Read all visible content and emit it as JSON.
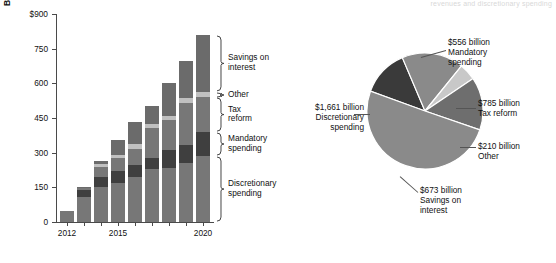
{
  "figure": {
    "top_note": "revenues and discretionary spending"
  },
  "chart_data": [
    {
      "type": "bar",
      "subtype": "stacked-bar",
      "title": "",
      "xlabel": "",
      "ylabel": "Billion",
      "y_axis_top_label": "$900",
      "ylim": [
        0,
        900
      ],
      "yticks": [
        0,
        150,
        300,
        450,
        600,
        750,
        900
      ],
      "ytick_labels": [
        "0",
        "150",
        "300",
        "450",
        "600",
        "750",
        "$900"
      ],
      "grid": false,
      "legend_position": "right-brackets",
      "categories": [
        "2012",
        "2013",
        "2014",
        "2015",
        "2016",
        "2017",
        "2018",
        "2019",
        "2020"
      ],
      "xtick_labels_shown": [
        "2012",
        "2015",
        "2020"
      ],
      "series": [
        {
          "name": "Discretionary spending",
          "color": "#777777",
          "values": [
            48,
            110,
            152,
            168,
            196,
            228,
            232,
            254,
            286
          ]
        },
        {
          "name": "Mandatory spending",
          "color": "#3f3f3f",
          "values": [
            0,
            28,
            42,
            52,
            50,
            48,
            78,
            78,
            104
          ]
        },
        {
          "name": "Tax reform",
          "color": "#777777",
          "values": [
            0,
            10,
            44,
            56,
            72,
            130,
            130,
            182,
            152
          ]
        },
        {
          "name": "Other",
          "color": "#c0c0c0",
          "values": [
            0,
            0,
            12,
            16,
            18,
            20,
            20,
            22,
            22
          ]
        },
        {
          "name": "Savings on interest",
          "color": "#6b6b6b",
          "values": [
            0,
            2,
            14,
            64,
            96,
            76,
            140,
            160,
            246
          ]
        }
      ],
      "totals": [
        48,
        150,
        264,
        356,
        432,
        502,
        600,
        696,
        810
      ],
      "bracket_labels": [
        "Savings on\ninterest",
        "Other",
        "Tax\nreform",
        "Mandatory\nspending",
        "Discretionary\nspending"
      ]
    },
    {
      "type": "pie",
      "title": "",
      "unit": "billion",
      "legend_position": "callout-labels",
      "slices": [
        {
          "label": "Discretionary spending",
          "value_text": "$1,661 billion",
          "value": 1661,
          "color": "#8a8a8a",
          "callout": "$1,661 billion\nDiscretionary\nspending"
        },
        {
          "label": "Mandatory spending",
          "value_text": "$556 billion",
          "value": 556,
          "color": "#3a3a3a",
          "callout": "$556 billion\nMandatory\nspending"
        },
        {
          "label": "Tax reform",
          "value_text": "$785 billion",
          "value": 785,
          "color": "#8a8a8a",
          "callout": "$785 billion\nTax reform"
        },
        {
          "label": "Other",
          "value_text": "$210 billion",
          "value": 210,
          "color": "#c8c8c8",
          "callout": "$210 billion\nOther"
        },
        {
          "label": "Savings on interest",
          "value_text": "$673 billion",
          "value": 673,
          "color": "#6e6e6e",
          "callout": "$673 billion\nSavings on\ninterest"
        }
      ]
    }
  ]
}
